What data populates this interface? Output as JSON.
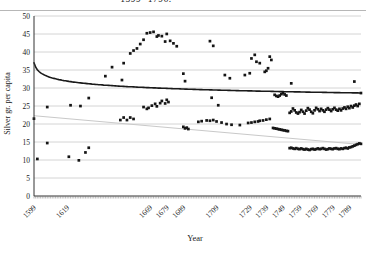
{
  "chart_data": {
    "type": "scatter",
    "title_fragment": "1599 -1796.",
    "xlabel": "Year",
    "ylabel": "Silver gr. per capita",
    "x_range": [
      1599,
      1796
    ],
    "ylim": [
      0,
      50
    ],
    "ytick_step": 5,
    "xticks": [
      1599,
      1619,
      1669,
      1679,
      1689,
      1709,
      1729,
      1739,
      1749,
      1759,
      1769,
      1779,
      1789
    ],
    "grid": "horizontal",
    "legend": "none",
    "colors": {
      "marker": "#151515",
      "power_trend": "#1a1a1a",
      "linear_trend": "#c9c9c9",
      "grid": "#c9c9c9",
      "axis": "#333333",
      "text": "#1a1a1a",
      "rule": "#b7b7b7"
    },
    "trendlines": [
      {
        "name": "power trend",
        "type": "power",
        "a": 37,
        "b": -0.0486,
        "n_origin_year": 1598,
        "width": 1.6,
        "color_key": "power_trend"
      },
      {
        "name": "linear trend",
        "type": "linear",
        "start": [
          1599,
          22.3
        ],
        "end": [
          1796,
          14.3
        ],
        "width": 1,
        "color_key": "linear_trend"
      }
    ],
    "series": [
      {
        "name": "Silver gr. per capita (annual observations)",
        "marker": "square",
        "marker_size": 2.7,
        "points": [
          [
            1599,
            21.5
          ],
          [
            1607,
            24.7
          ],
          [
            1621,
            25.2
          ],
          [
            1627,
            25.0
          ],
          [
            1632,
            27.2
          ],
          [
            1601,
            10.3
          ],
          [
            1607,
            14.7
          ],
          [
            1620,
            10.9
          ],
          [
            1626,
            9.9
          ],
          [
            1630,
            12.1
          ],
          [
            1632,
            13.4
          ],
          [
            1642,
            33.3
          ],
          [
            1652,
            32.2
          ],
          [
            1651,
            21.1
          ],
          [
            1653,
            21.8
          ],
          [
            1655,
            21.1
          ],
          [
            1657,
            21.8
          ],
          [
            1659,
            21.4
          ],
          [
            1665,
            24.7
          ],
          [
            1667,
            24.2
          ],
          [
            1668,
            24.5
          ],
          [
            1670,
            25.1
          ],
          [
            1672,
            25.6
          ],
          [
            1673,
            24.9
          ],
          [
            1675,
            25.8
          ],
          [
            1676,
            26.4
          ],
          [
            1678,
            25.7
          ],
          [
            1679,
            26.7
          ],
          [
            1680,
            26.1
          ],
          [
            1646,
            35.8
          ],
          [
            1653,
            36.9
          ],
          [
            1657,
            39.6
          ],
          [
            1659,
            40.4
          ],
          [
            1661,
            41.0
          ],
          [
            1663,
            42.2
          ],
          [
            1665,
            43.4
          ],
          [
            1667,
            45.2
          ],
          [
            1669,
            45.4
          ],
          [
            1671,
            45.6
          ],
          [
            1673,
            44.3
          ],
          [
            1674,
            44.6
          ],
          [
            1676,
            44.4
          ],
          [
            1678,
            42.9
          ],
          [
            1679,
            45.0
          ],
          [
            1681,
            43.1
          ],
          [
            1683,
            42.4
          ],
          [
            1685,
            41.6
          ],
          [
            1689,
            34.0
          ],
          [
            1690,
            31.9
          ],
          [
            1689,
            19.2
          ],
          [
            1690,
            18.8
          ],
          [
            1691,
            19.0
          ],
          [
            1692,
            18.6
          ],
          [
            1705,
            43.0
          ],
          [
            1707,
            41.7
          ],
          [
            1706,
            27.3
          ],
          [
            1710,
            25.2
          ],
          [
            1698,
            20.6
          ],
          [
            1700,
            20.8
          ],
          [
            1703,
            21.0
          ],
          [
            1705,
            20.9
          ],
          [
            1707,
            21.1
          ],
          [
            1709,
            20.7
          ],
          [
            1712,
            20.4
          ],
          [
            1715,
            20.0
          ],
          [
            1718,
            19.8
          ],
          [
            1723,
            19.7
          ],
          [
            1728,
            20.3
          ],
          [
            1730,
            20.4
          ],
          [
            1732,
            20.6
          ],
          [
            1734,
            20.7
          ],
          [
            1735,
            20.9
          ],
          [
            1737,
            21.0
          ],
          [
            1739,
            21.2
          ],
          [
            1741,
            21.4
          ],
          [
            1714,
            33.6
          ],
          [
            1717,
            32.7
          ],
          [
            1726,
            33.6
          ],
          [
            1729,
            34.1
          ],
          [
            1730,
            38.2
          ],
          [
            1732,
            39.2
          ],
          [
            1733,
            37.3
          ],
          [
            1735,
            36.9
          ],
          [
            1738,
            34.5
          ],
          [
            1739,
            34.8
          ],
          [
            1740,
            35.5
          ],
          [
            1741,
            38.7
          ],
          [
            1742,
            37.8
          ],
          [
            1743,
            18.9
          ],
          [
            1744,
            18.8
          ],
          [
            1745,
            18.7
          ],
          [
            1746,
            18.6
          ],
          [
            1747,
            18.5
          ],
          [
            1748,
            18.4
          ],
          [
            1749,
            18.3
          ],
          [
            1750,
            18.2
          ],
          [
            1751,
            18.1
          ],
          [
            1752,
            18.0
          ],
          [
            1744,
            28.1
          ],
          [
            1745,
            27.8
          ],
          [
            1746,
            27.6
          ],
          [
            1747,
            27.9
          ],
          [
            1748,
            28.3
          ],
          [
            1749,
            28.6
          ],
          [
            1750,
            28.2
          ],
          [
            1751,
            27.9
          ],
          [
            1754,
            31.3
          ],
          [
            1753,
            23.1
          ],
          [
            1754,
            23.5
          ],
          [
            1755,
            24.3
          ],
          [
            1756,
            23.8
          ],
          [
            1757,
            23.2
          ],
          [
            1758,
            22.9
          ],
          [
            1759,
            23.3
          ],
          [
            1760,
            23.9
          ],
          [
            1761,
            23.4
          ],
          [
            1762,
            22.9
          ],
          [
            1763,
            23.7
          ],
          [
            1764,
            24.4
          ],
          [
            1765,
            24.0
          ],
          [
            1766,
            23.4
          ],
          [
            1767,
            23.0
          ],
          [
            1768,
            23.8
          ],
          [
            1769,
            24.5
          ],
          [
            1770,
            24.1
          ],
          [
            1771,
            23.6
          ],
          [
            1772,
            24.2
          ],
          [
            1773,
            23.8
          ],
          [
            1774,
            23.4
          ],
          [
            1775,
            24.0
          ],
          [
            1776,
            24.4
          ],
          [
            1777,
            24.0
          ],
          [
            1778,
            23.6
          ],
          [
            1779,
            24.1
          ],
          [
            1780,
            24.5
          ],
          [
            1781,
            24.0
          ],
          [
            1782,
            23.7
          ],
          [
            1783,
            24.2
          ],
          [
            1784,
            23.8
          ],
          [
            1785,
            24.3
          ],
          [
            1786,
            24.6
          ],
          [
            1787,
            24.2
          ],
          [
            1788,
            24.8
          ],
          [
            1789,
            24.4
          ],
          [
            1790,
            25.0
          ],
          [
            1791,
            24.6
          ],
          [
            1792,
            25.1
          ],
          [
            1793,
            25.4
          ],
          [
            1794,
            25.0
          ],
          [
            1795,
            25.6
          ],
          [
            1792,
            31.8
          ],
          [
            1796,
            28.6
          ],
          [
            1753,
            13.3
          ],
          [
            1754,
            13.4
          ],
          [
            1755,
            13.2
          ],
          [
            1756,
            13.1
          ],
          [
            1757,
            13.3
          ],
          [
            1758,
            13.1
          ],
          [
            1759,
            13.0
          ],
          [
            1760,
            13.2
          ],
          [
            1761,
            13.0
          ],
          [
            1762,
            12.9
          ],
          [
            1763,
            13.1
          ],
          [
            1764,
            12.9
          ],
          [
            1765,
            12.8
          ],
          [
            1766,
            13.0
          ],
          [
            1767,
            13.1
          ],
          [
            1768,
            12.9
          ],
          [
            1769,
            13.0
          ],
          [
            1770,
            13.2
          ],
          [
            1771,
            13.0
          ],
          [
            1772,
            13.1
          ],
          [
            1773,
            13.3
          ],
          [
            1774,
            13.1
          ],
          [
            1775,
            12.9
          ],
          [
            1776,
            13.0
          ],
          [
            1777,
            13.2
          ],
          [
            1778,
            13.1
          ],
          [
            1779,
            13.0
          ],
          [
            1780,
            13.2
          ],
          [
            1781,
            13.3
          ],
          [
            1782,
            13.1
          ],
          [
            1783,
            13.0
          ],
          [
            1784,
            13.2
          ],
          [
            1785,
            13.1
          ],
          [
            1786,
            13.3
          ],
          [
            1787,
            13.4
          ],
          [
            1788,
            13.2
          ],
          [
            1789,
            13.5
          ],
          [
            1790,
            13.6
          ],
          [
            1791,
            13.8
          ],
          [
            1792,
            14.0
          ],
          [
            1793,
            14.2
          ],
          [
            1794,
            14.4
          ],
          [
            1795,
            14.6
          ],
          [
            1796,
            14.5
          ]
        ]
      }
    ]
  }
}
